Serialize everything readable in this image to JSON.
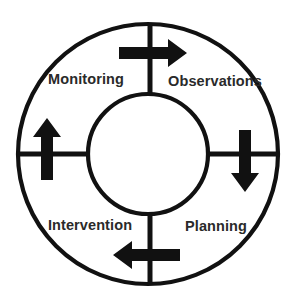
{
  "diagram": {
    "type": "cyclical-process",
    "direction": "clockwise",
    "colors": {
      "stroke": "#111111",
      "arrow": "#111111",
      "label_text": "#2a2a2a",
      "background": "#ffffff"
    },
    "geometry": {
      "center_x": 148,
      "center_y": 154,
      "outer_radius": 131,
      "inner_radius": 60,
      "ring_stroke_width": 4,
      "spoke_stroke_width": 5
    },
    "stages": [
      {
        "id": "monitoring",
        "label": "Monitoring",
        "quadrant": "upper-left",
        "label_x": 86,
        "label_y": 80
      },
      {
        "id": "observations",
        "label": "Observations",
        "quadrant": "upper-right",
        "label_x": 215,
        "label_y": 82
      },
      {
        "id": "intervention",
        "label": "Intervention",
        "quadrant": "lower-left",
        "label_x": 90,
        "label_y": 226
      },
      {
        "id": "planning",
        "label": "Planning",
        "quadrant": "lower-right",
        "label_x": 216,
        "label_y": 227
      }
    ],
    "arrows": [
      {
        "id": "arrow-top",
        "position": "top",
        "points_to": "right",
        "from_stage": "monitoring",
        "to_stage": "observations"
      },
      {
        "id": "arrow-right",
        "position": "right",
        "points_to": "down",
        "from_stage": "observations",
        "to_stage": "planning"
      },
      {
        "id": "arrow-bottom",
        "position": "bottom",
        "points_to": "left",
        "from_stage": "planning",
        "to_stage": "intervention"
      },
      {
        "id": "arrow-left",
        "position": "left",
        "points_to": "up",
        "from_stage": "intervention",
        "to_stage": "monitoring"
      }
    ],
    "spokes": [
      {
        "id": "spoke-north",
        "orientation": "vertical"
      },
      {
        "id": "spoke-east",
        "orientation": "horizontal"
      },
      {
        "id": "spoke-south",
        "orientation": "vertical"
      },
      {
        "id": "spoke-west",
        "orientation": "horizontal"
      }
    ]
  }
}
